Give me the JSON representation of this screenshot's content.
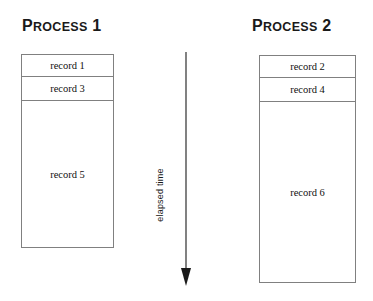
{
  "diagram": {
    "title_bar": null,
    "background_color": "#ffffff",
    "line_color": "#808080",
    "arrow_color": "#1a1a1a",
    "text_color": "#111111"
  },
  "columns": [
    {
      "title_initial": "P",
      "title_rest": "ROCESS",
      "title_number": "1",
      "title_full": "Process 1",
      "records": [
        {
          "label": "record 1",
          "height_px": 22
        },
        {
          "label": "record 3",
          "height_px": 24
        },
        {
          "label": "record 5",
          "height_px": 148
        }
      ]
    },
    {
      "title_initial": "P",
      "title_rest": "ROCESS",
      "title_number": "2",
      "title_full": "Process 2",
      "records": [
        {
          "label": "record 2",
          "height_px": 22
        },
        {
          "label": "record 4",
          "height_px": 24
        },
        {
          "label": "record 6",
          "height_px": 182
        }
      ]
    }
  ],
  "axis": {
    "label": "elapsed time",
    "direction": "downward",
    "icon": "down-arrow-icon"
  }
}
